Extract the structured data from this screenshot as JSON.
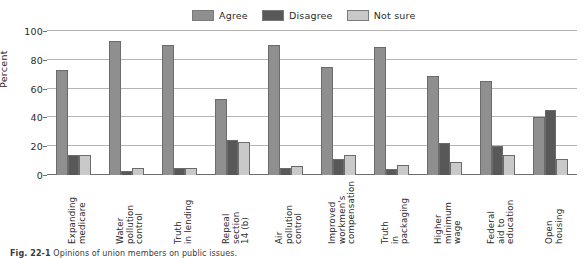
{
  "chart_data": {
    "type": "bar",
    "title": "",
    "xlabel": "",
    "ylabel": "Percent",
    "ylim": [
      0,
      100
    ],
    "ytick_values": [
      0,
      20,
      40,
      60,
      80,
      100
    ],
    "ytick_labels": [
      "0",
      "20",
      "40",
      "60",
      "80",
      "100"
    ],
    "grid": true,
    "legend_position": "top-center",
    "categories": [
      "Expanding\nmedicare",
      "Water\npollution\ncontrol",
      "Truth\nin lending",
      "Repeal\nsection\n14 (b)",
      "Air\npollution\ncontrol",
      "Improved\nworkmen's\ncompensation",
      "Truth\nin\npackaging",
      "Higher\nminimum\nwage",
      "Federal\naid to\neducation",
      "Open\nhousing"
    ],
    "series": [
      {
        "name": "Agree",
        "color": "#8f8f8f",
        "values": [
          73,
          93,
          90,
          53,
          90,
          75,
          89,
          69,
          65,
          40
        ]
      },
      {
        "name": "Disagree",
        "color": "#585858",
        "values": [
          14,
          3,
          5,
          24,
          5,
          11,
          4,
          22,
          20,
          45
        ]
      },
      {
        "name": "Not sure",
        "color": "#c9c9c9",
        "values": [
          14,
          5,
          5,
          23,
          6,
          14,
          7,
          9,
          14,
          11
        ]
      }
    ]
  },
  "legend": {
    "items": [
      {
        "label": "Agree",
        "color": "#8f8f8f"
      },
      {
        "label": "Disagree",
        "color": "#585858"
      },
      {
        "label": "Not sure",
        "color": "#c9c9c9"
      }
    ]
  },
  "caption": {
    "number": "Fig. 22-1",
    "text": "Opinions of union members on public issues."
  }
}
